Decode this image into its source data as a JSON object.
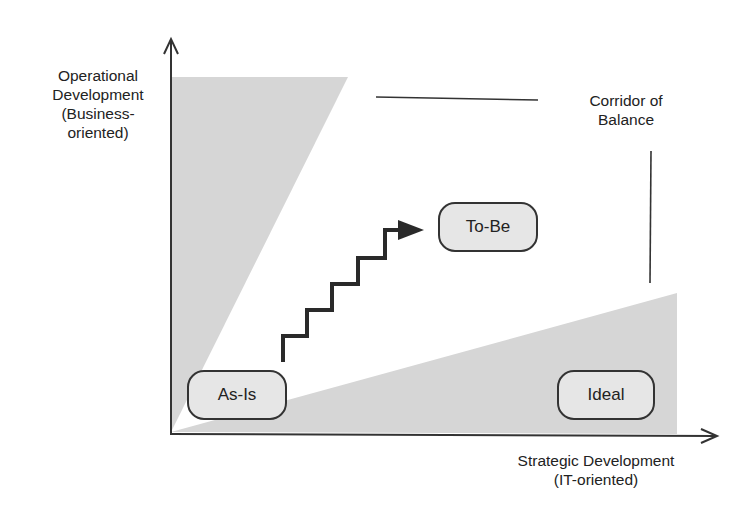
{
  "diagram": {
    "y_axis_label": [
      "Operational",
      "Development",
      "(Business-",
      "oriented)"
    ],
    "x_axis_label": [
      "Strategic Development",
      "(IT-oriented)"
    ],
    "corridor_label": [
      "Corridor of",
      "Balance"
    ],
    "states": {
      "as_is": "As-Is",
      "to_be": "To-Be",
      "ideal": "Ideal"
    },
    "colors": {
      "shade": "#d6d6d6",
      "line": "#333333",
      "pill_fill": "#e6e6e6"
    }
  }
}
